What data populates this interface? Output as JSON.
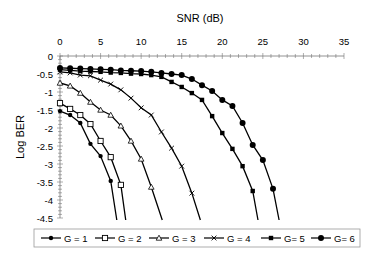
{
  "chart_data": {
    "type": "line",
    "title": "",
    "xlabel": "SNR (dB)",
    "ylabel": "Log BER",
    "xlim": [
      0,
      35
    ],
    "ylim": [
      -4.5,
      0
    ],
    "x_ticks": [
      0,
      5,
      10,
      15,
      20,
      25,
      30,
      35
    ],
    "y_ticks": [
      0,
      -0.5,
      -1,
      -1.5,
      -2,
      -2.5,
      -3,
      -3.5,
      -4,
      -4.5
    ],
    "x_tick_labels": [
      "0",
      "5",
      "10",
      "15",
      "20",
      "25",
      "30",
      "35"
    ],
    "y_tick_labels": [
      "0",
      "-0.5",
      "-1",
      "-1.5",
      "-2",
      "-2.5",
      "-3",
      "-3.5",
      "-4",
      "-4.5"
    ],
    "x_axis_position": "top",
    "grid": false,
    "legend_position": "bottom",
    "series": [
      {
        "name": "G = 1",
        "marker": "small-filled-circle",
        "x": [
          0,
          1.25,
          2.5,
          3.75,
          5,
          6.25
        ],
        "y": [
          -1.53,
          -1.64,
          -1.86,
          -2.44,
          -2.78,
          -3.47
        ],
        "tail_x": 7.0
      },
      {
        "name": "G = 2",
        "marker": "open-square",
        "x": [
          0,
          1.25,
          2.5,
          3.75,
          5,
          6.25,
          7.5
        ],
        "y": [
          -1.31,
          -1.47,
          -1.64,
          -1.89,
          -2.36,
          -2.81,
          -3.58
        ],
        "tail_x": 8.1
      },
      {
        "name": "G = 3",
        "marker": "open-triangle",
        "x": [
          0,
          1.25,
          2.5,
          3.75,
          5,
          6.25,
          7.5,
          8.75,
          10,
          11.25
        ],
        "y": [
          -0.75,
          -0.83,
          -1.03,
          -1.28,
          -1.5,
          -1.64,
          -1.94,
          -2.36,
          -2.86,
          -3.64
        ],
        "tail_x": 12.6
      },
      {
        "name": "G = 4",
        "marker": "x-cross",
        "x": [
          0,
          1.25,
          2.5,
          3.75,
          5,
          6.25,
          7.5,
          8.75,
          10,
          11.25,
          12.5,
          13.75,
          15,
          16.25
        ],
        "y": [
          -0.44,
          -0.47,
          -0.53,
          -0.55,
          -0.67,
          -0.78,
          -0.94,
          -1.17,
          -1.44,
          -1.64,
          -2.11,
          -2.56,
          -3.06,
          -3.81
        ],
        "tail_x": 17.3
      },
      {
        "name": "G= 5",
        "marker": "filled-square",
        "x": [
          0,
          1.25,
          2.5,
          3.75,
          5,
          6.25,
          7.5,
          8.75,
          10,
          11.25,
          12.5,
          13.75,
          15,
          16.25,
          17.5,
          18.75,
          20,
          21.25
        ],
        "y": [
          -0.38,
          -0.4,
          -0.42,
          -0.43,
          -0.44,
          -0.46,
          -0.47,
          -0.49,
          -0.5,
          -0.53,
          -0.58,
          -0.72,
          -0.86,
          -1.03,
          -1.22,
          -1.67,
          -2.14,
          -2.58
        ],
        "extra_x": [
          22.5,
          23.75
        ],
        "extra_y": [
          -3.06,
          -3.75
        ],
        "tail_x": 24.4
      },
      {
        "name": "G= 6",
        "marker": "large-filled-circle",
        "x": [
          0,
          1.25,
          2.5,
          3.75,
          5,
          6.25,
          7.5,
          8.75,
          10,
          11.25,
          12.5,
          13.75,
          15,
          16.25,
          17.5,
          18.75,
          20,
          21.25,
          22.5,
          23.75,
          25,
          26.25
        ],
        "y": [
          -0.33,
          -0.34,
          -0.35,
          -0.36,
          -0.37,
          -0.38,
          -0.4,
          -0.41,
          -0.42,
          -0.44,
          -0.47,
          -0.5,
          -0.53,
          -0.64,
          -0.81,
          -0.97,
          -1.22,
          -1.39,
          -1.86,
          -2.47,
          -2.89,
          -3.69
        ],
        "tail_x": 27.0
      }
    ]
  }
}
